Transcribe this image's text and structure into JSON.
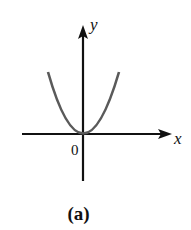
{
  "figure": {
    "caption": "(a)",
    "x_axis_label": "x",
    "y_axis_label": "y",
    "origin_label": "0",
    "curve": {
      "type": "parabola",
      "equation": "y = x^2",
      "color": "#555555",
      "vertex": [
        0,
        0
      ],
      "opens": "up"
    },
    "axis_color": "#111111"
  }
}
